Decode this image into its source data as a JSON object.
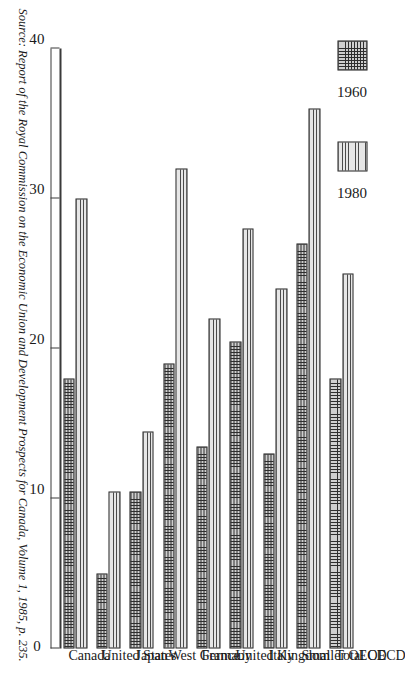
{
  "legend": {
    "position": "top-left",
    "entries": [
      {
        "label": "1960",
        "pattern": "cross-hatch"
      },
      {
        "label": "1980",
        "pattern": "horizontal-lines"
      }
    ]
  },
  "source": {
    "text": "Source: Report of the Royal Commission on the Economic Union and Development Prospects for Canada, Volume 1, 1985, p. 235."
  },
  "chart_data": {
    "type": "bar",
    "orientation": "horizontal-rotated",
    "title": "",
    "xlabel": "",
    "ylabel": "",
    "ylim": [
      0,
      40
    ],
    "grid": false,
    "ticks": [
      0,
      10,
      20,
      30,
      40
    ],
    "tick_labels": [
      "0",
      "10",
      "20",
      "30",
      "40"
    ],
    "categories": [
      "Total OECD",
      "Smaller OECD",
      "Italy",
      "United Kingdom",
      "France",
      "West Germany",
      "Japan",
      "United States",
      "Canada"
    ],
    "series": [
      {
        "name": "1960",
        "values": [
          18.0,
          27.0,
          13.0,
          20.5,
          13.5,
          19.0,
          10.5,
          5.0,
          18.0
        ]
      },
      {
        "name": "1980",
        "values": [
          25.0,
          36.0,
          24.0,
          28.0,
          22.0,
          32.0,
          14.5,
          10.5,
          30.0
        ]
      }
    ]
  }
}
